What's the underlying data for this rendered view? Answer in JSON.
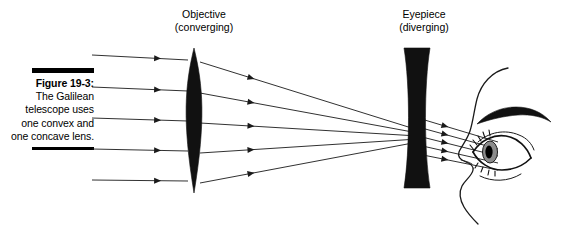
{
  "figure": {
    "caption_title": "Figure 19-3:",
    "caption_body": "The Galilean telescope uses one convex and one concave lens.",
    "rule_color": "#000000"
  },
  "labels": {
    "objective": {
      "line1": "Objective",
      "line2": "(converging)"
    },
    "eyepiece": {
      "line1": "Eyepiece",
      "line2": "(diverging)"
    }
  },
  "diagram": {
    "stroke_color": "#1a1a1a",
    "lens_fill": "#111111",
    "background": "#ffffff",
    "iris_fill": "#8c8c8c",
    "pupil_fill": "#000000"
  },
  "chart_data": {
    "type": "diagram",
    "elements": [
      {
        "name": "objective-lens",
        "shape": "biconvex",
        "center_x": 194,
        "top_y": 48,
        "bottom_y": 193,
        "max_half_width": 12
      },
      {
        "name": "eyepiece-lens",
        "shape": "biconcave",
        "center_x": 417,
        "top_y": 48,
        "bottom_y": 188,
        "edge_half_width": 13,
        "waist_half_width": 6
      },
      {
        "name": "eye",
        "center_x": 492,
        "center_y": 148
      }
    ],
    "incoming_rays": [
      {
        "x1": 92,
        "y1": 55,
        "x2": 188,
        "y2": 60
      },
      {
        "x1": 92,
        "y1": 87,
        "x2": 188,
        "y2": 91
      },
      {
        "x1": 92,
        "y1": 118,
        "x2": 188,
        "y2": 121
      },
      {
        "x1": 92,
        "y1": 149,
        "x2": 188,
        "y2": 151
      },
      {
        "x1": 92,
        "y1": 180,
        "x2": 188,
        "y2": 181
      }
    ],
    "converging_rays": [
      {
        "x1": 200,
        "y1": 62,
        "x2": 418,
        "y2": 130
      },
      {
        "x1": 200,
        "y1": 93,
        "x2": 418,
        "y2": 133
      },
      {
        "x1": 200,
        "y1": 123,
        "x2": 418,
        "y2": 136
      },
      {
        "x1": 200,
        "y1": 153,
        "x2": 418,
        "y2": 139
      },
      {
        "x1": 200,
        "y1": 183,
        "x2": 418,
        "y2": 142
      }
    ],
    "exit_rays": [
      {
        "x1": 418,
        "y1": 118,
        "x2": 498,
        "y2": 142
      },
      {
        "x1": 418,
        "y1": 127,
        "x2": 498,
        "y2": 149
      },
      {
        "x1": 418,
        "y1": 136,
        "x2": 498,
        "y2": 156
      },
      {
        "x1": 418,
        "y1": 145,
        "x2": 498,
        "y2": 163
      },
      {
        "x1": 418,
        "y1": 154,
        "x2": 498,
        "y2": 170
      }
    ]
  }
}
